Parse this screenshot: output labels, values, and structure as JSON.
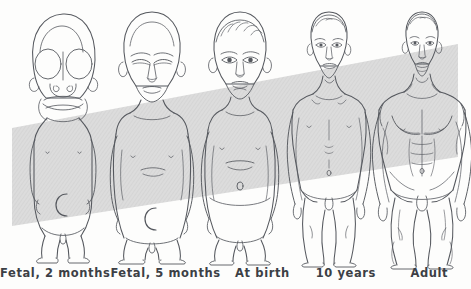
{
  "figure": {
    "background_color": "#fdfdfc",
    "band_color": "#d9d9d9",
    "line_color": "#55585e",
    "baseline_y": 262
  },
  "captions": [
    {
      "label": "Fetal, 2 months"
    },
    {
      "label": "Fetal, 5 months"
    },
    {
      "label": "At birth"
    },
    {
      "label": "10 years"
    },
    {
      "label": "Adult"
    }
  ],
  "subjects": [
    {
      "name": "fetal-2-months",
      "caption": "Fetal, 2 months",
      "head_top_y": 14,
      "feet_y": 262,
      "center_x": 63
    },
    {
      "name": "fetal-5-months",
      "caption": "Fetal, 5 months",
      "head_top_y": 12,
      "feet_y": 262,
      "center_x": 152
    },
    {
      "name": "at-birth",
      "caption": "At birth",
      "head_top_y": 12,
      "feet_y": 262,
      "center_x": 240
    },
    {
      "name": "ten-years",
      "caption": "10 years",
      "head_top_y": 12,
      "feet_y": 262,
      "center_x": 329
    },
    {
      "name": "adult",
      "caption": "Adult",
      "head_top_y": 12,
      "feet_y": 262,
      "center_x": 422
    }
  ]
}
